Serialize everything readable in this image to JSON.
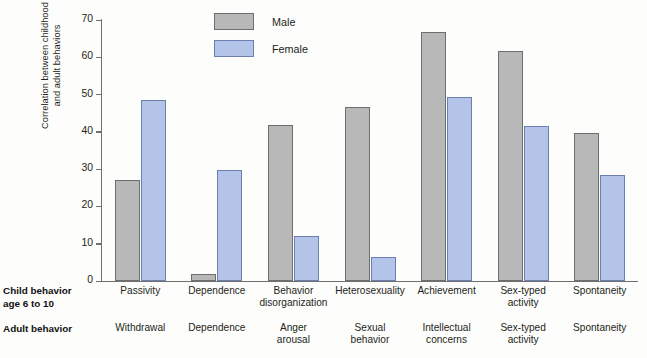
{
  "chart_data": {
    "type": "bar",
    "title": "",
    "subtitle": "",
    "xlabel": "",
    "ylabel": "Correlation between childhood and adult behaviors",
    "ylim": [
      0,
      70
    ],
    "yticks": [
      0,
      10,
      20,
      30,
      40,
      50,
      60,
      70
    ],
    "grid": false,
    "legend_position": "top-center",
    "categories": [
      "Passivity",
      "Dependence",
      "Behavior disorganization",
      "Heterosexuality",
      "Achievement",
      "Sex-typed activity",
      "Spontaneity"
    ],
    "series": [
      {
        "name": "Male",
        "color": "#b8b8b8",
        "values": [
          27.0,
          2.0,
          41.8,
          46.6,
          66.8,
          61.8,
          39.7
        ]
      },
      {
        "name": "Female",
        "color": "#b3c4e8",
        "values": [
          48.5,
          29.8,
          12.0,
          6.5,
          49.4,
          41.5,
          28.4
        ]
      }
    ]
  },
  "ylabel": {
    "line1": "Correlation between childhood",
    "line2": "and adult behaviors",
    "full": "Correlation between childhood and adult behaviors"
  },
  "legend": {
    "items": [
      {
        "label": "Male",
        "color": "#b8b8b8"
      },
      {
        "label": "Female",
        "color": "#b3c4e8"
      }
    ]
  },
  "axis": {
    "yticks": [
      "0",
      "10",
      "20",
      "30",
      "40",
      "50",
      "60",
      "70"
    ]
  },
  "rows": {
    "child": {
      "label_line1": "Child behavior",
      "label_line2": "age 6 to 10"
    },
    "adult": {
      "label_line1": "Adult behavior",
      "label_line2": ""
    }
  },
  "categories": [
    {
      "child_line1": "Passivity",
      "child_line2": "",
      "adult_line1": "Withdrawal",
      "adult_line2": ""
    },
    {
      "child_line1": "Dependence",
      "child_line2": "",
      "adult_line1": "Dependence",
      "adult_line2": ""
    },
    {
      "child_line1": "Behavior",
      "child_line2": "disorganization",
      "adult_line1": "Anger",
      "adult_line2": "arousal"
    },
    {
      "child_line1": "Heterosexuality",
      "child_line2": "",
      "adult_line1": "Sexual",
      "adult_line2": "behavior"
    },
    {
      "child_line1": "Achievement",
      "child_line2": "",
      "adult_line1": "Intellectual",
      "adult_line2": "concerns"
    },
    {
      "child_line1": "Sex-typed",
      "child_line2": "activity",
      "adult_line1": "Sex-typed",
      "adult_line2": "activity"
    },
    {
      "child_line1": "Spontaneity",
      "child_line2": "",
      "adult_line1": "Spontaneity",
      "adult_line2": ""
    }
  ]
}
